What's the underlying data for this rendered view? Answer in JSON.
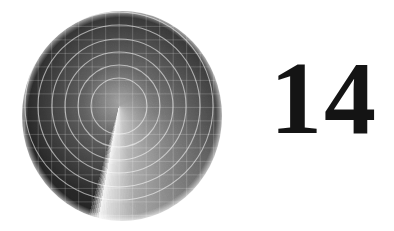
{
  "page": {
    "background_color": "#ffffff",
    "width": 394,
    "height": 231
  },
  "chapter": {
    "number": "14"
  },
  "figure": {
    "name": "radar-sweep-disc",
    "center_x": 118,
    "center_y": 102,
    "radius": 101,
    "grid_spacing": 13.5,
    "sweep_line_angle_deg": 190,
    "dark_color": "#121212",
    "mid_color": "#6e6e6e",
    "light_color": "#e6e6e6",
    "grid_line_color": "#b4b4b4",
    "arc_line_color": "#ffffff",
    "arc_radii": [
      28,
      41,
      54,
      67,
      81,
      94
    ],
    "conic_stops": [
      {
        "angle_deg": 0,
        "value": "#121212"
      },
      {
        "angle_deg": 55,
        "value": "#1c1c1c"
      },
      {
        "angle_deg": 100,
        "value": "#3a3a3a"
      },
      {
        "angle_deg": 140,
        "value": "#6a6a6a"
      },
      {
        "angle_deg": 170,
        "value": "#9a9a9a"
      },
      {
        "angle_deg": 186,
        "value": "#d8d8d8"
      },
      {
        "angle_deg": 190,
        "value": "#efefef"
      },
      {
        "angle_deg": 196,
        "value": "#101010"
      },
      {
        "angle_deg": 300,
        "value": "#0e0e0e"
      },
      {
        "angle_deg": 360,
        "value": "#121212"
      }
    ]
  }
}
